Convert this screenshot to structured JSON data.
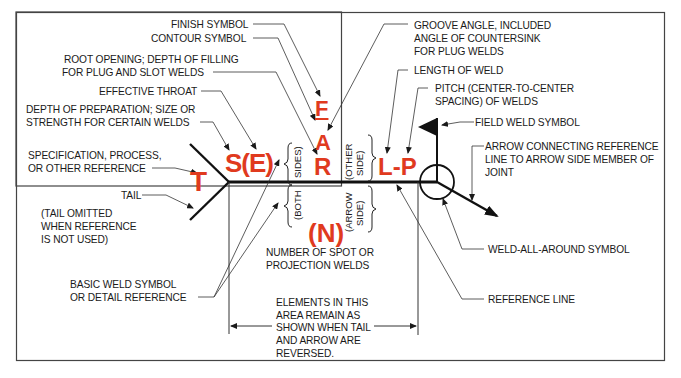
{
  "diagram": {
    "accent_color": "#e03a1e",
    "symbols": {
      "T": "T",
      "SE": "S(E)",
      "F": "F",
      "A": "A",
      "R": "R",
      "LP": "L-P",
      "N": "(N)"
    },
    "side_labels": {
      "sides": "SIDES)",
      "both": "(BOTH",
      "other_1": "(OTHER",
      "other_2": "SIDE)",
      "arrow_1": "(ARROW",
      "arrow_2": "SIDE)"
    },
    "labels": {
      "finish_symbol": "FINISH SYMBOL",
      "contour_symbol": "CONTOUR SYMBOL",
      "root_opening_1": "ROOT OPENING; DEPTH OF FILLING",
      "root_opening_2": "FOR PLUG AND SLOT WELDS",
      "effective_throat": "EFFECTIVE THROAT",
      "depth_prep_1": "DEPTH OF PREPARATION; SIZE OR",
      "depth_prep_2": "STRENGTH FOR CERTAIN WELDS",
      "spec_1": "SPECIFICATION, PROCESS,",
      "spec_2": "OR OTHER REFERENCE",
      "tail": "TAIL",
      "tail_omit_1": "(TAIL OMITTED",
      "tail_omit_2": "WHEN REFERENCE",
      "tail_omit_3": "IS NOT USED)",
      "basic_weld_1": "BASIC WELD SYMBOL",
      "basic_weld_2": "OR DETAIL REFERENCE",
      "number_spot_1": "NUMBER OF SPOT OR",
      "number_spot_2": "PROJECTION WELDS",
      "elements_1": "ELEMENTS IN THIS",
      "elements_2": "AREA REMAIN AS",
      "elements_3": "SHOWN WHEN TAIL",
      "elements_4": "AND ARROW ARE",
      "elements_5": "REVERSED.",
      "groove_1": "GROOVE ANGLE, INCLUDED",
      "groove_2": "ANGLE OF COUNTERSINK",
      "groove_3": "FOR PLUG WELDS",
      "length": "LENGTH OF WELD",
      "pitch_1": "PITCH (CENTER-TO-CENTER",
      "pitch_2": "SPACING) OF WELDS",
      "field_weld": "FIELD WELD SYMBOL",
      "arrow_conn_1": "ARROW CONNECTING REFERENCE",
      "arrow_conn_2": "LINE TO ARROW SIDE MEMBER OF",
      "arrow_conn_3": "JOINT",
      "weld_all_around": "WELD-ALL-AROUND SYMBOL",
      "reference_line": "REFERENCE LINE"
    }
  }
}
